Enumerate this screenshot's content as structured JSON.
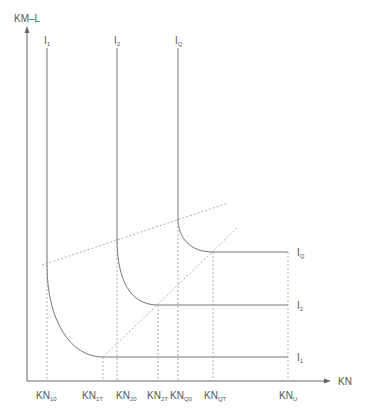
{
  "axes": {
    "y_label": "KM–L",
    "x_label": "KN"
  },
  "curves": {
    "top_labels": [
      {
        "main": "I",
        "sub": "1"
      },
      {
        "main": "I",
        "sub": "2"
      },
      {
        "main": "I",
        "sub": "Q"
      }
    ],
    "right_labels": [
      {
        "main": "I",
        "sub": "Q"
      },
      {
        "main": "I",
        "sub": "2"
      },
      {
        "main": "I",
        "sub": "1"
      }
    ]
  },
  "x_ticks": [
    {
      "main": "KN",
      "sub": "10"
    },
    {
      "main": "KN",
      "sub": "1T"
    },
    {
      "main": "KN",
      "sub": "20"
    },
    {
      "main": "KN",
      "sub": "2T"
    },
    {
      "main": "KN",
      "sub": "Q0"
    },
    {
      "main": "KN",
      "sub": "QT"
    },
    {
      "main": "KN",
      "sub": "U"
    }
  ]
}
